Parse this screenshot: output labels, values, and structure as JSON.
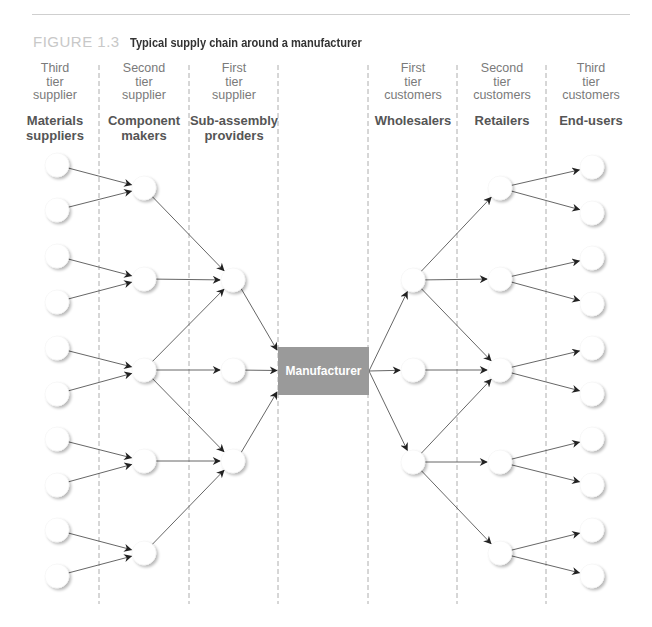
{
  "figure": {
    "number": "FIGURE 1.3",
    "title": "Typical supply chain around a manufacturer"
  },
  "columns": [
    {
      "tier": [
        "Third",
        "tier",
        "supplier"
      ],
      "role": [
        "Materials",
        "suppliers"
      ]
    },
    {
      "tier": [
        "Second",
        "tier",
        "supplier"
      ],
      "role": [
        "Component",
        "makers"
      ]
    },
    {
      "tier": [
        "First",
        "tier",
        "supplier"
      ],
      "role": [
        "Sub-assembly",
        "providers"
      ]
    },
    {
      "tier": [],
      "role": []
    },
    {
      "tier": [
        "First",
        "tier",
        "customers"
      ],
      "role": [
        "Wholesalers"
      ]
    },
    {
      "tier": [
        "Second",
        "tier",
        "customers"
      ],
      "role": [
        "Retailers"
      ]
    },
    {
      "tier": [
        "Third",
        "tier",
        "customers"
      ],
      "role": [
        "End-users"
      ]
    }
  ],
  "center": {
    "label": "Manufacturer",
    "color": "#9a9a9a"
  },
  "colors": {
    "edge": "#555555",
    "arrow": "#222222",
    "divider": "#9a9a9a",
    "node_fill": "#ffffff",
    "node_shadow": "#d6d6d6"
  },
  "network": {
    "node_counts": [
      10,
      5,
      3,
      1,
      3,
      5,
      10
    ],
    "edges": [
      [
        "0.0",
        "1.0"
      ],
      [
        "0.1",
        "1.0"
      ],
      [
        "0.2",
        "1.1"
      ],
      [
        "0.3",
        "1.1"
      ],
      [
        "0.4",
        "1.2"
      ],
      [
        "0.5",
        "1.2"
      ],
      [
        "0.6",
        "1.3"
      ],
      [
        "0.7",
        "1.3"
      ],
      [
        "0.8",
        "1.4"
      ],
      [
        "0.9",
        "1.4"
      ],
      [
        "1.0",
        "2.0"
      ],
      [
        "1.1",
        "2.0"
      ],
      [
        "1.2",
        "2.0"
      ],
      [
        "1.2",
        "2.1"
      ],
      [
        "1.2",
        "2.2"
      ],
      [
        "1.3",
        "2.2"
      ],
      [
        "1.4",
        "2.2"
      ],
      [
        "2.0",
        "3.0"
      ],
      [
        "2.1",
        "3.0"
      ],
      [
        "2.2",
        "3.0"
      ],
      [
        "3.0",
        "4.0"
      ],
      [
        "3.0",
        "4.1"
      ],
      [
        "3.0",
        "4.2"
      ],
      [
        "4.0",
        "5.0"
      ],
      [
        "4.0",
        "5.1"
      ],
      [
        "4.0",
        "5.2"
      ],
      [
        "4.1",
        "5.2"
      ],
      [
        "4.2",
        "5.2"
      ],
      [
        "4.2",
        "5.3"
      ],
      [
        "4.2",
        "5.4"
      ],
      [
        "5.0",
        "6.0"
      ],
      [
        "5.0",
        "6.1"
      ],
      [
        "5.1",
        "6.2"
      ],
      [
        "5.1",
        "6.3"
      ],
      [
        "5.2",
        "6.4"
      ],
      [
        "5.2",
        "6.5"
      ],
      [
        "5.3",
        "6.6"
      ],
      [
        "5.3",
        "6.7"
      ],
      [
        "5.4",
        "6.8"
      ],
      [
        "5.4",
        "6.9"
      ]
    ]
  }
}
